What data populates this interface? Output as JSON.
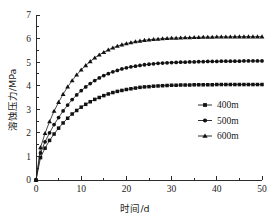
{
  "chart_data": {
    "type": "line",
    "title": "",
    "xlabel": "时间/d",
    "ylabel": "溶蚀压力/MPa",
    "xlim": [
      0,
      50
    ],
    "ylim": [
      0,
      7
    ],
    "xticks": [
      0,
      10,
      20,
      30,
      40,
      50
    ],
    "yticks": [
      0,
      1,
      2,
      3,
      4,
      5,
      6,
      7
    ],
    "xtick_labels": [
      "0",
      "10",
      "20",
      "30",
      "40",
      "50"
    ],
    "ytick_labels": [
      "0",
      "1",
      "2",
      "3",
      "4",
      "5",
      "6",
      "7"
    ],
    "x_minor_step": 5,
    "y_minor_step": 0.5,
    "grid": false,
    "legend_position": "center-right",
    "frame": "left-bottom",
    "x": [
      0,
      1,
      2,
      3,
      4,
      5,
      6,
      7,
      8,
      9,
      10,
      11,
      12,
      13,
      14,
      15,
      16,
      17,
      18,
      19,
      20,
      21,
      22,
      23,
      24,
      25,
      26,
      27,
      28,
      29,
      30,
      31,
      32,
      33,
      34,
      35,
      36,
      37,
      38,
      39,
      40,
      41,
      42,
      43,
      44,
      45,
      46,
      47,
      48,
      49,
      50
    ],
    "series": [
      {
        "name": "400m",
        "marker": "square",
        "plateau": 4.05,
        "values": [
          0,
          0.95,
          1.35,
          1.68,
          1.95,
          2.2,
          2.42,
          2.62,
          2.8,
          2.95,
          3.09,
          3.21,
          3.32,
          3.42,
          3.5,
          3.58,
          3.65,
          3.71,
          3.76,
          3.8,
          3.84,
          3.87,
          3.9,
          3.93,
          3.95,
          3.96,
          3.98,
          3.99,
          4.0,
          4.01,
          4.02,
          4.02,
          4.03,
          4.03,
          4.03,
          4.04,
          4.04,
          4.04,
          4.04,
          4.04,
          4.05,
          4.05,
          4.05,
          4.05,
          4.05,
          4.05,
          4.05,
          4.05,
          4.05,
          4.05,
          4.05
        ]
      },
      {
        "name": "500m",
        "marker": "circle",
        "plateau": 5.05,
        "values": [
          0,
          1.15,
          1.62,
          2.0,
          2.35,
          2.65,
          2.93,
          3.18,
          3.41,
          3.61,
          3.79,
          3.95,
          4.09,
          4.22,
          4.33,
          4.43,
          4.51,
          4.59,
          4.65,
          4.71,
          4.76,
          4.8,
          4.83,
          4.86,
          4.89,
          4.91,
          4.93,
          4.95,
          4.96,
          4.97,
          4.98,
          4.99,
          5.0,
          5.0,
          5.01,
          5.01,
          5.02,
          5.02,
          5.03,
          5.03,
          5.03,
          5.04,
          5.04,
          5.04,
          5.04,
          5.04,
          5.05,
          5.05,
          5.05,
          5.05,
          5.05
        ]
      },
      {
        "name": "600m",
        "marker": "triangle",
        "plateau": 6.08,
        "values": [
          0,
          1.38,
          1.98,
          2.48,
          2.92,
          3.3,
          3.64,
          3.95,
          4.22,
          4.46,
          4.67,
          4.86,
          5.03,
          5.18,
          5.31,
          5.42,
          5.52,
          5.61,
          5.68,
          5.74,
          5.79,
          5.83,
          5.87,
          5.9,
          5.93,
          5.95,
          5.97,
          5.98,
          6.0,
          6.01,
          6.02,
          6.02,
          6.03,
          6.04,
          6.04,
          6.05,
          6.05,
          6.06,
          6.06,
          6.06,
          6.07,
          6.07,
          6.07,
          6.07,
          6.08,
          6.08,
          6.08,
          6.08,
          6.08,
          6.08,
          6.08
        ]
      }
    ],
    "legend": [
      {
        "label": "400m",
        "marker": "square"
      },
      {
        "label": "500m",
        "marker": "circle"
      },
      {
        "label": "600m",
        "marker": "triangle"
      }
    ],
    "colors": {
      "axis": "#2b2b2b",
      "series": "#1a1a1a",
      "background": "#ffffff"
    }
  }
}
